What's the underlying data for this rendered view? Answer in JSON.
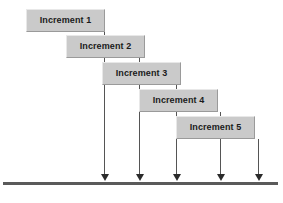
{
  "diagram": {
    "type": "staircase-increment-timeline",
    "canvas": {
      "width": 283,
      "height": 203,
      "background": "#ffffff"
    },
    "style": {
      "box_fill": "#cacaca",
      "box_highlight": "#e8e8e8",
      "box_shadow": "#9a9a9a",
      "text_color": "#1a1a1a",
      "arrow_color": "#555555",
      "arrow_head_color": "#2b2b2b",
      "baseline_color": "#5a5a5a"
    },
    "baseline": {
      "name": "timeline",
      "x": 3,
      "y": 182,
      "width": 275,
      "height": 3
    },
    "increments": [
      {
        "label": "Increment 1",
        "box": {
          "x": 26,
          "y": 9,
          "width": 79,
          "height": 23
        },
        "arrow": {
          "x": 104,
          "top": 32,
          "bottom": 182
        }
      },
      {
        "label": "Increment 2",
        "box": {
          "x": 66,
          "y": 35,
          "width": 79,
          "height": 23
        },
        "arrow": {
          "x": 139,
          "top": 58,
          "bottom": 182
        }
      },
      {
        "label": "Increment 3",
        "box": {
          "x": 102,
          "y": 62,
          "width": 79,
          "height": 23
        },
        "arrow": {
          "x": 176,
          "top": 85,
          "bottom": 182
        }
      },
      {
        "label": "Increment 4",
        "box": {
          "x": 139,
          "y": 89,
          "width": 79,
          "height": 23
        },
        "arrow": {
          "x": 220,
          "top": 112,
          "bottom": 182
        }
      },
      {
        "label": "Increment 5",
        "box": {
          "x": 176,
          "y": 116,
          "width": 79,
          "height": 23
        },
        "arrow": {
          "x": 258,
          "top": 139,
          "bottom": 182
        }
      }
    ]
  }
}
